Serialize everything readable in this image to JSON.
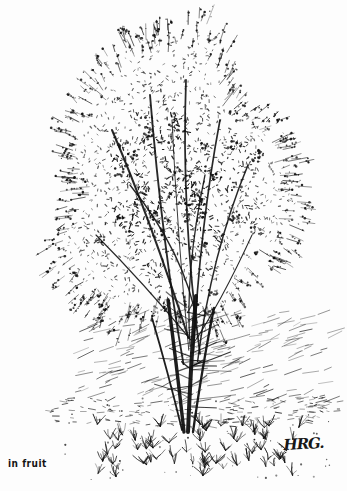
{
  "plate": {
    "title": "in fruit",
    "caption": "in fruit",
    "signature": "HRG.",
    "background_color": "#fdfdfd",
    "ink_color": "#111111",
    "width": 347,
    "height": 491
  },
  "artwork": {
    "subject": "deciduous tree in fruit",
    "medium": "pen-and-ink stipple drawing",
    "canopy": {
      "center_x": 172,
      "center_y": 185,
      "radius_x": 120,
      "radius_y": 150,
      "top_y": 18,
      "bottom_y": 330,
      "left_x": 30,
      "right_x": 312,
      "stipple_count": 5200,
      "cluster_count": 420,
      "twig_count": 300
    },
    "trunk": {
      "base_x": 190,
      "base_y": 432,
      "top_y": 300,
      "stem_count": 4,
      "branch_count": 34
    },
    "ground": {
      "horizon_y": 400,
      "hatch_count": 240,
      "grass_tuft_count": 95,
      "dot_count": 160
    }
  }
}
